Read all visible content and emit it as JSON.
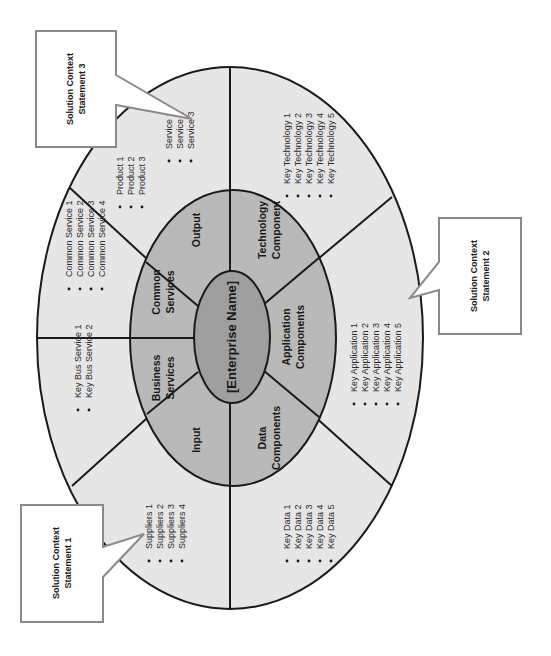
{
  "diagram": {
    "orientation": "rotated 90 degrees counter-clockwise",
    "core": {
      "label": "[Enterprise Name]"
    },
    "segments": [
      {
        "id": "output",
        "label_lines": [
          "Output"
        ],
        "items": [
          "Product 1",
          "Product 2",
          "Product 3"
        ],
        "items2": [
          "Service 1",
          "Service 2",
          "Service 3"
        ]
      },
      {
        "id": "common-services",
        "label_lines": [
          "Common",
          "Services"
        ],
        "items": [
          "Common Service 1",
          "Common Service 2",
          "Common Service 3",
          "Common Service 4"
        ]
      },
      {
        "id": "business-services",
        "label_lines": [
          "Business",
          "Services"
        ],
        "items": [
          "Key Bus Service 1",
          "Key Bus Service 2"
        ]
      },
      {
        "id": "input",
        "label_lines": [
          "Input"
        ],
        "items": [
          "Suppliers 1",
          "Suppliers 2",
          "Suppliers 3",
          "Suppliers 4"
        ]
      },
      {
        "id": "data-components",
        "label_lines": [
          "Data",
          "Components"
        ],
        "items": [
          "Key Data 1",
          "Key Data 2",
          "Key Data 3",
          "Key Data 4",
          "Key Data 5"
        ]
      },
      {
        "id": "application-components",
        "label_lines": [
          "Application",
          "Components"
        ],
        "items": [
          "Key Application 1",
          "Key Application 2",
          "Key Application 3",
          "Key Application 4",
          "Key Application 5"
        ]
      },
      {
        "id": "technology-component",
        "label_lines": [
          "Technology",
          "Component"
        ],
        "items": [
          "Key Technology 1",
          "Key Technology 2",
          "Key Technology 3",
          "Key Technology 4",
          "Key Technology 5"
        ]
      }
    ],
    "callouts": [
      {
        "id": "statement-3",
        "lines": [
          "Solution Context",
          "Statement 3"
        ]
      },
      {
        "id": "statement-2",
        "lines": [
          "Solution Context",
          "Statement 2"
        ]
      },
      {
        "id": "statement-1",
        "lines": [
          "Solution Context",
          "Statement 1"
        ]
      }
    ],
    "colors": {
      "outer_ring": "#e6e6e6",
      "middle_ring": "#b9b9b9",
      "core": "#9f9f9f",
      "lines": "#1a1a1a",
      "callout_border": "#8a8a8a"
    }
  }
}
